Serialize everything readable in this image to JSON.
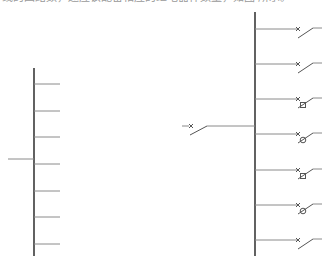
{
  "caption": {
    "text_fragment": "线的回路数，还应该配备相应的继电器件数量，如图 所示。",
    "note": "top line clipped; only lower edge of glyphs visible"
  },
  "colors": {
    "bus": "#3a3a3a",
    "branch": "#8a8a8a",
    "symbol": "#555555",
    "background": "#ffffff"
  },
  "left_bus": {
    "x": 34,
    "y_top": 68,
    "y_bottom": 256,
    "incoming": {
      "y": 159,
      "x_start": 8
    },
    "branches": [
      {
        "y": 84,
        "x_end": 60
      },
      {
        "y": 111,
        "x_end": 60
      },
      {
        "y": 137,
        "x_end": 60
      },
      {
        "y": 164,
        "x_end": 60
      },
      {
        "y": 191,
        "x_end": 60
      },
      {
        "y": 217,
        "x_end": 60
      },
      {
        "y": 244,
        "x_end": 60
      }
    ]
  },
  "right_bus": {
    "x": 255,
    "y_top": 12,
    "y_bottom": 256,
    "incoming_switch": {
      "y": 126,
      "cross_x": 191,
      "blade_from": [
        190,
        135
      ],
      "blade_to": [
        207,
        126
      ]
    },
    "branches": [
      {
        "y": 29,
        "accessory": "none"
      },
      {
        "y": 64,
        "accessory": "none"
      },
      {
        "y": 99,
        "accessory": "square"
      },
      {
        "y": 134,
        "accessory": "circle"
      },
      {
        "y": 170,
        "accessory": "square"
      },
      {
        "y": 205,
        "accessory": "circle"
      },
      {
        "y": 240,
        "accessory": "none"
      }
    ],
    "branch_geometry": {
      "line_end_x": 297,
      "cross_x": 298,
      "blade_start_x": 298,
      "blade_end_x": 313,
      "tail_end_x": 322
    }
  },
  "icons": {
    "breaker_cross": "circuit-breaker-x-mark",
    "switch_blade": "open-switch-blade",
    "square_accessory": "overcurrent-relay-square",
    "circle_accessory": "thermal-relay-circle"
  }
}
